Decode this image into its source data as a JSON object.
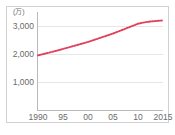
{
  "chart_data": {
    "type": "line",
    "title": "",
    "subtitle": "",
    "xlabel": "",
    "ylabel": "",
    "unit_label": "(万)",
    "grid": true,
    "legend": false,
    "legend_position": "none",
    "line_color": "#e2415c",
    "marker_style": "dotted",
    "axis_color": "#b9b9b9",
    "gridline_color": "#e6e6e6",
    "text_color": "#6b6b6b",
    "xlim": [
      1990,
      2015
    ],
    "ylim": [
      0,
      3500
    ],
    "y_ticks": [
      1000,
      2000,
      3000
    ],
    "y_tick_labels": [
      "1,000",
      "2,000",
      "3,000"
    ],
    "x_ticks": [
      1990,
      1995,
      2000,
      2005,
      2010,
      2015
    ],
    "x_tick_labels": [
      "1990",
      "95",
      "00",
      "05",
      "10",
      "2015"
    ],
    "x": [
      1990,
      1991,
      1992,
      1993,
      1994,
      1995,
      1996,
      1997,
      1998,
      1999,
      2000,
      2001,
      2002,
      2003,
      2004,
      2005,
      2006,
      2007,
      2008,
      2009,
      2010,
      2011,
      2012,
      2013,
      2014,
      2015
    ],
    "values": [
      1950,
      1995,
      2040,
      2085,
      2130,
      2180,
      2230,
      2280,
      2330,
      2380,
      2430,
      2490,
      2550,
      2610,
      2670,
      2730,
      2800,
      2870,
      2940,
      3010,
      3080,
      3120,
      3150,
      3170,
      3185,
      3200
    ],
    "series": [
      {
        "name": "series-1",
        "values": [
          1950,
          1995,
          2040,
          2085,
          2130,
          2180,
          2230,
          2280,
          2330,
          2380,
          2430,
          2490,
          2550,
          2610,
          2670,
          2730,
          2800,
          2870,
          2940,
          3010,
          3080,
          3120,
          3150,
          3170,
          3185,
          3200
        ]
      }
    ]
  }
}
